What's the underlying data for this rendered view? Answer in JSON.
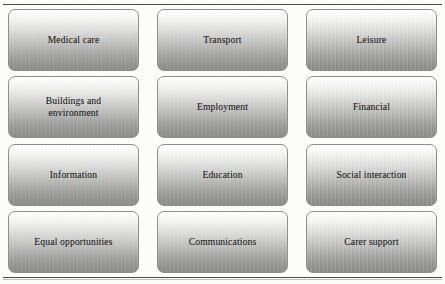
{
  "page": {
    "clipped_heading_fragment": "",
    "rules": {
      "top_label": "top-divider-rule",
      "bottom_label": "bottom-divider-rule"
    }
  },
  "colors": {
    "box_gradient_top": "#ffffff",
    "box_gradient_bottom": "#8c8c8b",
    "box_border": "#8d8d8b",
    "text": "#1d1d1c",
    "rule": "#4a4a48",
    "page_background": "#fdfdfc"
  },
  "grid": {
    "columns": 3,
    "rows": 4,
    "cells": [
      {
        "id": "medical-care",
        "label": "Medical care"
      },
      {
        "id": "transport",
        "label": "Transport"
      },
      {
        "id": "leisure",
        "label": "Leisure"
      },
      {
        "id": "buildings-environment",
        "label": "Buildings and\nenvironment"
      },
      {
        "id": "employment",
        "label": "Employment"
      },
      {
        "id": "financial",
        "label": "Financial"
      },
      {
        "id": "information",
        "label": "Information"
      },
      {
        "id": "education",
        "label": "Education"
      },
      {
        "id": "social-interaction",
        "label": "Social interaction"
      },
      {
        "id": "equal-opportunities",
        "label": "Equal opportunities"
      },
      {
        "id": "communications",
        "label": "Communications"
      },
      {
        "id": "carer-support",
        "label": "Carer support"
      }
    ]
  }
}
